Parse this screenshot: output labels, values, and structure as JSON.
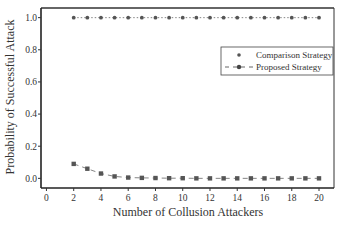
{
  "chart_data": {
    "type": "line",
    "title": "",
    "xlabel": "Number of Collusion Attackers",
    "ylabel": "Probability of Successful Attack",
    "xlim": [
      -0.4,
      21.1
    ],
    "ylim": [
      -0.06,
      1.06
    ],
    "xticks": [
      0,
      2,
      4,
      6,
      8,
      10,
      12,
      14,
      16,
      18,
      20
    ],
    "xtick_labels": [
      "0",
      "2",
      "4",
      "6",
      "8",
      "10",
      "12",
      "14",
      "16",
      "18",
      "20"
    ],
    "yticks": [
      0.0,
      0.2,
      0.4,
      0.6,
      0.8,
      1.0
    ],
    "ytick_labels": [
      "0.0",
      "0.2",
      "0.4",
      "0.6",
      "0.8",
      "1.0"
    ],
    "grid": false,
    "legend_position": "right",
    "x": [
      2,
      3,
      4,
      5,
      6,
      7,
      8,
      9,
      10,
      11,
      12,
      13,
      14,
      15,
      16,
      17,
      18,
      19,
      20
    ],
    "series": [
      {
        "name": "Comparison Strategy",
        "marker": "circle",
        "line": "dotted",
        "color": "#555555",
        "values": [
          1.0,
          1.0,
          1.0,
          1.0,
          1.0,
          1.0,
          1.0,
          1.0,
          1.0,
          1.0,
          1.0,
          1.0,
          1.0,
          1.0,
          1.0,
          1.0,
          1.0,
          1.0,
          1.0
        ]
      },
      {
        "name": "Proposed Strategy",
        "marker": "square",
        "line": "dashed",
        "color": "#555555",
        "values": [
          0.09,
          0.06,
          0.03,
          0.012,
          0.005,
          0.003,
          0.002,
          0.001,
          0.001,
          0.0,
          0.0,
          0.0,
          0.0,
          0.0,
          0.0,
          0.0,
          0.0,
          0.0,
          0.0
        ]
      }
    ]
  }
}
